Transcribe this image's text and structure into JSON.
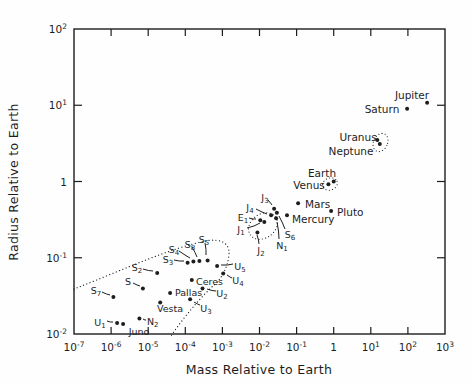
{
  "figure": {
    "background": "#fefefe",
    "ink_color": "#1d1d1d"
  },
  "axes": {
    "x": {
      "title": "Mass Relative to Earth",
      "scale": "log",
      "ticks": [
        {
          "exp": -7,
          "label": "10^-7"
        },
        {
          "exp": -6,
          "label": "10^-6"
        },
        {
          "exp": -5,
          "label": "10^-5"
        },
        {
          "exp": -4,
          "label": "10^-4"
        },
        {
          "exp": -3,
          "label": "10^-3"
        },
        {
          "exp": -2,
          "label": "10^-2"
        },
        {
          "exp": -1,
          "label": "10^-1"
        },
        {
          "exp": 0,
          "label": "1"
        },
        {
          "exp": 1,
          "label": "10^1"
        },
        {
          "exp": 2,
          "label": "10^2"
        },
        {
          "exp": 3,
          "label": "10^3"
        }
      ]
    },
    "y": {
      "title": "Radius Relative to Earth",
      "scale": "log",
      "ticks": [
        {
          "exp": 2,
          "label": "10^2"
        },
        {
          "exp": 1,
          "label": "10^1"
        },
        {
          "exp": 0,
          "label": "1"
        },
        {
          "exp": -1,
          "label": "10^-1"
        },
        {
          "exp": -2,
          "label": "10^-2"
        }
      ]
    }
  },
  "chart_data": {
    "type": "scatter",
    "title": "",
    "xlabel": "Mass Relative to Earth",
    "ylabel": "Radius Relative to Earth",
    "x_range": [
      1e-07,
      1000
    ],
    "y_range": [
      0.01,
      100
    ],
    "grid": false,
    "points": [
      {
        "label": "Jupiter",
        "mass": 330,
        "radius": 10.8,
        "lx": 412,
        "ly": 95,
        "anchor": "middle"
      },
      {
        "label": "Saturn",
        "mass": 95,
        "radius": 9.0,
        "lx": 382,
        "ly": 109,
        "anchor": "middle"
      },
      {
        "label": "Uranus",
        "mass": 15,
        "radius": 3.5,
        "lx": 358,
        "ly": 137,
        "anchor": "middle"
      },
      {
        "label": "Neptune",
        "mass": 17.5,
        "radius": 3.1,
        "lx": 351,
        "ly": 151,
        "anchor": "middle"
      },
      {
        "label": "Earth",
        "mass": 1,
        "radius": 1,
        "lx": 322,
        "ly": 173,
        "anchor": "middle"
      },
      {
        "label": "Venus",
        "mass": 0.72,
        "radius": 0.92,
        "lx": 309,
        "ly": 185,
        "anchor": "middle"
      },
      {
        "label": "Mars",
        "mass": 0.11,
        "radius": 0.52,
        "lx": 305,
        "ly": 204,
        "anchor": "start"
      },
      {
        "label": "Mercury",
        "mass": 0.055,
        "radius": 0.36,
        "lx": 292,
        "ly": 219,
        "anchor": "start"
      },
      {
        "label": "Pluto",
        "mass": 0.85,
        "radius": 0.41,
        "lx": 337,
        "ly": 212,
        "anchor": "start"
      },
      {
        "label": "J_3",
        "mass": 0.0247,
        "radius": 0.44,
        "lx": 265,
        "ly": 197,
        "anchor": "middle",
        "small": true,
        "leader": [
          268,
          200,
          272,
          205
        ]
      },
      {
        "label": "J_4",
        "mass": 0.0205,
        "radius": 0.36,
        "lx": 250,
        "ly": 207,
        "anchor": "middle",
        "small": true,
        "leader": [
          256,
          209,
          267,
          214
        ]
      },
      {
        "label": "S_6",
        "mass": 0.0295,
        "radius": 0.39,
        "lx": 290,
        "ly": 234,
        "anchor": "middle",
        "small": true,
        "leader": [
          285,
          229,
          279,
          216
        ]
      },
      {
        "label": "N_1",
        "mass": 0.028,
        "radius": 0.33,
        "lx": 282,
        "ly": 245,
        "anchor": "middle",
        "small": true,
        "leader": [
          279,
          239,
          277,
          222
        ]
      },
      {
        "label": "E_1",
        "mass": 0.0105,
        "radius": 0.31,
        "lx": 243,
        "ly": 217,
        "anchor": "middle",
        "small": true,
        "leader": [
          249,
          218,
          256,
          219
        ]
      },
      {
        "label": "J_1",
        "mass": 0.0135,
        "radius": 0.295,
        "lx": 241,
        "ly": 229,
        "anchor": "middle",
        "small": true,
        "leader": [
          247,
          228,
          260,
          223
        ]
      },
      {
        "label": "J_2",
        "mass": 0.0088,
        "radius": 0.215,
        "lx": 261,
        "ly": 250,
        "anchor": "middle",
        "small": true,
        "leader": [
          259,
          244,
          257,
          235
        ]
      },
      {
        "label": "S_5",
        "mass": 0.0004,
        "radius": 0.092,
        "lx": 204,
        "ly": 239,
        "anchor": "middle",
        "small": true,
        "leader": [
          205,
          243,
          206,
          255
        ]
      },
      {
        "label": "S_8",
        "mass": 0.00024,
        "radius": 0.091,
        "lx": 190,
        "ly": 244,
        "anchor": "middle",
        "small": true,
        "leader": [
          192,
          247,
          197,
          257
        ]
      },
      {
        "label": "S_4",
        "mass": 0.000165,
        "radius": 0.089,
        "lx": 174,
        "ly": 249,
        "anchor": "middle",
        "small": true,
        "leader": [
          179,
          251,
          190,
          258
        ]
      },
      {
        "label": "S_3",
        "mass": 0.000115,
        "radius": 0.086,
        "lx": 168,
        "ly": 259,
        "anchor": "middle",
        "small": true,
        "leader": [
          174,
          260,
          184,
          261
        ]
      },
      {
        "label": "S_2",
        "mass": 1.75e-05,
        "radius": 0.063,
        "lx": 137,
        "ly": 267,
        "anchor": "middle",
        "small": true,
        "leader": [
          143,
          269,
          153,
          271
        ]
      },
      {
        "label": "S",
        "mass": 7.2e-06,
        "radius": 0.0395,
        "lx": 128,
        "ly": 281,
        "anchor": "middle",
        "small": true,
        "leader": [
          133,
          283,
          140,
          286
        ]
      },
      {
        "label": "S_7",
        "mass": 1.15e-06,
        "radius": 0.0305,
        "lx": 96,
        "ly": 290,
        "anchor": "middle",
        "small": true,
        "leader": [
          102,
          292,
          110,
          295
        ]
      },
      {
        "label": "U_5",
        "mass": 0.00072,
        "radius": 0.078,
        "lx": 240,
        "ly": 266,
        "anchor": "middle",
        "small": true,
        "leader": [
          233,
          264,
          221,
          265
        ]
      },
      {
        "label": "U_4",
        "mass": 0.00105,
        "radius": 0.062,
        "lx": 238,
        "ly": 280,
        "anchor": "middle",
        "small": true,
        "leader": [
          232,
          278,
          227,
          275
        ]
      },
      {
        "label": "U_2",
        "mass": 0.00029,
        "radius": 0.0395,
        "lx": 222,
        "ly": 293,
        "anchor": "middle",
        "small": true,
        "leader": [
          216,
          291,
          207,
          289
        ]
      },
      {
        "label": "U_3",
        "mass": 0.000135,
        "radius": 0.0285,
        "lx": 206,
        "ly": 308,
        "anchor": "middle",
        "small": true,
        "leader": [
          200,
          305,
          194,
          302
        ]
      },
      {
        "label": "U_1",
        "mass": 1.45e-06,
        "radius": 0.014,
        "lx": 100,
        "ly": 322,
        "anchor": "middle",
        "small": true,
        "leader": [
          107,
          321,
          113,
          322
        ]
      },
      {
        "label": "N_2",
        "mass": 5.8e-06,
        "radius": 0.016,
        "lx": 147,
        "ly": 321,
        "anchor": "start",
        "small": true,
        "leader": [
          146,
          320,
          143,
          319
        ]
      },
      {
        "label": "Ceres",
        "mass": 0.00015,
        "radius": 0.051,
        "lx": 196,
        "ly": 281,
        "anchor": "start",
        "small": true
      },
      {
        "label": "Pallas",
        "mass": 3.9e-05,
        "radius": 0.0345,
        "lx": 175,
        "ly": 292,
        "anchor": "start",
        "small": true
      },
      {
        "label": "Vesta",
        "mass": 2.1e-05,
        "radius": 0.026,
        "lx": 170,
        "ly": 308,
        "anchor": "middle",
        "small": true
      },
      {
        "label": "Juno",
        "mass": 2.1e-06,
        "radius": 0.0135,
        "lx": 139,
        "ly": 331,
        "anchor": "middle",
        "small": true
      }
    ],
    "group_ellipses": [
      {
        "name": "venus-earth-group",
        "cx": 330,
        "cy": 184,
        "rx": 7.5,
        "ry": 6,
        "rot": -20
      },
      {
        "name": "uranus-neptune-group",
        "cx": 380.5,
        "cy": 142.5,
        "rx": 7,
        "ry": 9.5,
        "rot": 25
      },
      {
        "name": "large-moons-group",
        "cx": 263,
        "cy": 226,
        "rx": 15.5,
        "ry": 12,
        "rot": -35
      }
    ],
    "boundary_curve": "M 74 289 C 118 272 172 247 206 241 C 220 238 230 243 229 254 C 228 267 222 278 214 285 C 205 293 185 315 171 336"
  }
}
